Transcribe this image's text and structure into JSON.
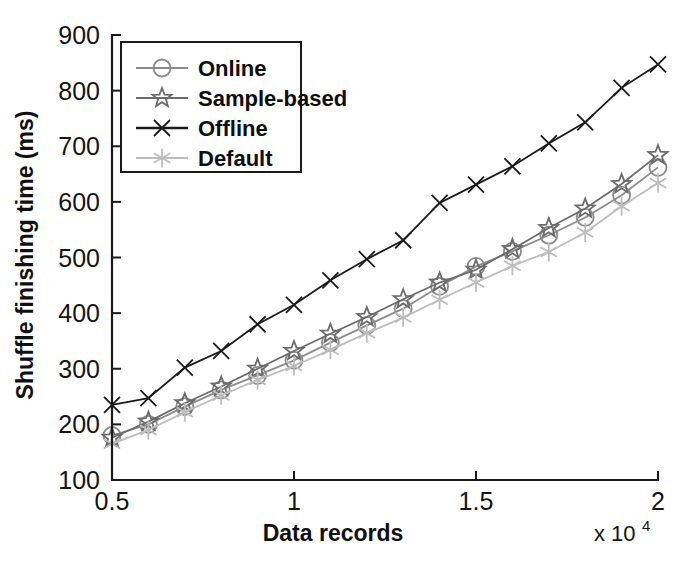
{
  "chart_data": {
    "type": "line",
    "title": "",
    "xlabel": "Data records",
    "ylabel": "Shuffle finishing time (ms)",
    "x_multiplier": "x 10",
    "x_multiplier_exponent": "4",
    "xlim": [
      0.5,
      2.0
    ],
    "ylim": [
      100,
      900
    ],
    "xticks": [
      0.5,
      1,
      1.5,
      2
    ],
    "xtick_labels": [
      "0.5",
      "1",
      "1.5",
      "2"
    ],
    "yticks": [
      100,
      200,
      300,
      400,
      500,
      600,
      700,
      800,
      900
    ],
    "ytick_labels": [
      "100",
      "200",
      "300",
      "400",
      "500",
      "600",
      "700",
      "800",
      "900"
    ],
    "grid": false,
    "legend_position": "upper-left",
    "x": [
      0.5,
      0.6,
      0.7,
      0.8,
      0.9,
      1.0,
      1.1,
      1.2,
      1.3,
      1.4,
      1.5,
      1.6,
      1.7,
      1.8,
      1.9,
      2.0
    ],
    "series": [
      {
        "name": "Online",
        "marker": "circle",
        "color": "#8c8c8c",
        "values": [
          180,
          200,
          232,
          262,
          288,
          315,
          347,
          378,
          408,
          448,
          484,
          511,
          540,
          572,
          612,
          662
        ]
      },
      {
        "name": "Sample-based",
        "marker": "star",
        "color": "#6b6b6b",
        "values": [
          176,
          205,
          238,
          268,
          300,
          332,
          363,
          393,
          425,
          455,
          478,
          515,
          553,
          588,
          632,
          684
        ]
      },
      {
        "name": "Offline",
        "marker": "x",
        "color": "#1a1a1a",
        "values": [
          235,
          247,
          302,
          332,
          380,
          415,
          459,
          497,
          531,
          598,
          631,
          664,
          705,
          743,
          805,
          847
        ]
      },
      {
        "name": "Default",
        "marker": "asterisk",
        "color": "#bdbdbd",
        "values": [
          165,
          190,
          222,
          252,
          280,
          305,
          334,
          364,
          392,
          424,
          455,
          485,
          510,
          545,
          592,
          634
        ]
      }
    ]
  }
}
